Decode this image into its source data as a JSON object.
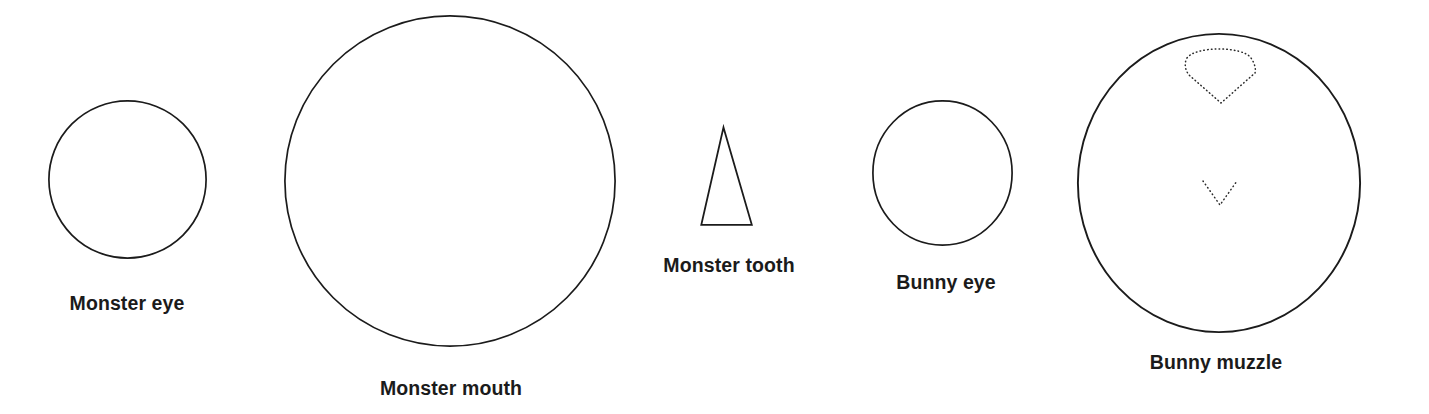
{
  "page": {
    "background_color": "#ffffff",
    "stroke_color": "#1b1b1b",
    "label_color": "#1b1b1b",
    "width": 1429,
    "height": 414
  },
  "pieces": [
    {
      "id": "monster-eye",
      "label": "Monster eye",
      "shape": "circle",
      "diameter_px": 159,
      "center": {
        "x": 127,
        "y": 180
      },
      "stroke": "#1b1b1b",
      "stroke_style": "solid",
      "fill": "#ffffff"
    },
    {
      "id": "monster-mouth",
      "label": "Monster mouth",
      "shape": "circle",
      "diameter_px": 332,
      "center": {
        "x": 450,
        "y": 181
      },
      "stroke": "#1b1b1b",
      "stroke_style": "solid",
      "fill": "#ffffff"
    },
    {
      "id": "monster-tooth",
      "label": "Monster tooth",
      "shape": "triangle",
      "width_px": 52,
      "height_px": 99,
      "center": {
        "x": 726,
        "y": 176
      },
      "stroke": "#1b1b1b",
      "stroke_style": "solid",
      "fill": "#ffffff"
    },
    {
      "id": "bunny-eye",
      "label": "Bunny eye",
      "shape": "circle",
      "diameter_px": 141,
      "center": {
        "x": 943,
        "y": 172
      },
      "stroke": "#1b1b1b",
      "stroke_style": "solid",
      "fill": "#ffffff"
    },
    {
      "id": "bunny-muzzle",
      "label": "Bunny muzzle",
      "shape": "circle",
      "diameter_px": 284,
      "center": {
        "x": 1219,
        "y": 188
      },
      "stroke": "#1b1b1b",
      "stroke_style": "solid",
      "fill": "#ffffff",
      "interior_marks": [
        {
          "id": "bunny-nose",
          "shape": "rounded-fan-nose",
          "stroke_style": "dotted",
          "bounds": {
            "x": 1186,
            "y": 118,
            "width": 70,
            "height": 35
          }
        },
        {
          "id": "bunny-mouth",
          "shape": "v-line",
          "stroke_style": "dotted",
          "bounds": {
            "x": 1203,
            "y": 181,
            "width": 34,
            "height": 24
          }
        }
      ]
    }
  ]
}
